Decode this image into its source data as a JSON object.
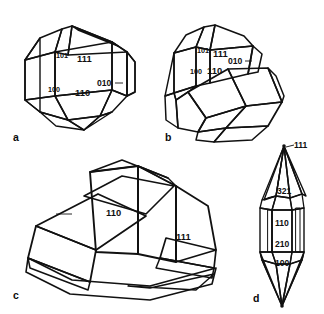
{
  "figure": {
    "kind": "crystal-habit-plate",
    "background_color": "#ffffff",
    "ink_color": "#111111",
    "panel_count": 4,
    "face_light_color": "#e9e9e9",
    "face_mid_color": "#d2d2d2",
    "face_dark_color": "#9a9a9a",
    "face_shade_color": "#8d8d8d"
  },
  "panels": [
    {
      "id": "a",
      "letter": "a",
      "style": "line-drawing-shaded",
      "description": "dodecahedral-trapezohedral combination crystal",
      "labels": [
        {
          "text": "101",
          "size": "sm"
        },
        {
          "text": "111",
          "size": "lg"
        },
        {
          "text": "010",
          "size": "md",
          "has_leader": true
        },
        {
          "text": "100",
          "size": "sm"
        },
        {
          "text": "110",
          "size": "lg"
        }
      ]
    },
    {
      "id": "b",
      "letter": "b",
      "style": "line-drawing-shaded",
      "description": "prismatic crystal with dark lower termination",
      "labels": [
        {
          "text": "101",
          "size": "sm"
        },
        {
          "text": "111",
          "size": "lg"
        },
        {
          "text": "010",
          "size": "md",
          "has_leader": true
        },
        {
          "text": "100",
          "size": "sm"
        },
        {
          "text": "110",
          "size": "lg"
        }
      ]
    },
    {
      "id": "c",
      "letter": "c",
      "style": "engraving-hatched",
      "description": "twinned blocky crystal group drawn with hatching",
      "labels": [
        {
          "text": "110",
          "size": "lg"
        },
        {
          "text": "111",
          "size": "lg"
        }
      ]
    },
    {
      "id": "d",
      "letter": "d",
      "style": "line-drawing-shaded",
      "description": "elongate bipyramidal crystal",
      "labels": [
        {
          "text": "111",
          "size": "md",
          "has_leader": true
        },
        {
          "text": "321",
          "size": "md"
        },
        {
          "text": "110",
          "size": "md"
        },
        {
          "text": "210",
          "size": "md"
        },
        {
          "text": "100",
          "size": "md"
        }
      ]
    }
  ],
  "labels_flat": {
    "a_101": "101",
    "a_111": "111",
    "a_010": "010",
    "a_100": "100",
    "a_110": "110",
    "b_101": "101",
    "b_111": "111",
    "b_010": "010",
    "b_100": "100",
    "b_110": "110",
    "c_110": "110",
    "c_111": "111",
    "d_111": "111",
    "d_321": "321",
    "d_110": "110",
    "d_210": "210",
    "d_100": "100",
    "letter_a": "a",
    "letter_b": "b",
    "letter_c": "c",
    "letter_d": "d"
  }
}
